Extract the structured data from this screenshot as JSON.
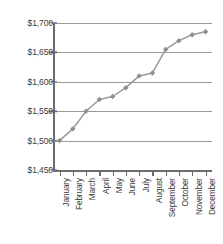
{
  "chart_data": {
    "type": "line",
    "title": "",
    "subtitle": "",
    "xlabel": "",
    "ylabel": "",
    "categories": [
      "January",
      "February",
      "March",
      "April",
      "May",
      "June",
      "July",
      "August",
      "September",
      "October",
      "November",
      "December"
    ],
    "values": [
      1500,
      1520,
      1550,
      1570,
      1575,
      1590,
      1610,
      1615,
      1655,
      1670,
      1680,
      1685
    ],
    "series": [
      {
        "name": "",
        "values": [
          1500,
          1520,
          1550,
          1570,
          1575,
          1590,
          1610,
          1615,
          1655,
          1670,
          1680,
          1685
        ]
      }
    ],
    "ylim": [
      1450,
      1700
    ],
    "ytick_values": [
      1700,
      1650,
      1600,
      1550,
      1500,
      1450
    ],
    "ytick_labels": [
      "$1,700",
      "$1,650",
      "$1,600",
      "$1,550",
      "$1,500",
      "$1,450"
    ],
    "ytick_step": 50,
    "grid": true,
    "grid_axis": "y",
    "legend": false,
    "legend_position": "none",
    "marker": "diamond",
    "xtick_label_rotation": -90,
    "colors": {
      "line": "#9a9a9a",
      "marker": "#8f8f8f",
      "grid": "#9a9a9a",
      "axis": "#6d6d6d",
      "text": "#3a3a3a",
      "background": "#ffffff"
    }
  }
}
